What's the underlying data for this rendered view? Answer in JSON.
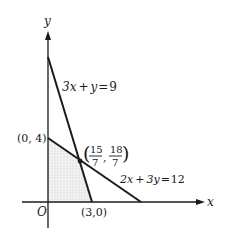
{
  "diagram": {
    "type": "linear-programming-feasible-region",
    "axes": {
      "x_label": "x",
      "y_label": "y",
      "origin_label": "O"
    },
    "lines": [
      {
        "id": "line1",
        "equation": "3x + y = 9",
        "lhs_a": "3x",
        "plus": "+",
        "lhs_b": "y",
        "eq": "=",
        "rhs": "9",
        "endpoints": [
          [
            0,
            9
          ],
          [
            3,
            0
          ]
        ]
      },
      {
        "id": "line2",
        "equation": "2x + 3y = 12",
        "lhs_a": "2x",
        "plus": "+",
        "lhs_b": "3y",
        "eq": "=",
        "rhs": "12",
        "endpoints": [
          [
            0,
            4
          ],
          [
            6,
            0
          ]
        ]
      }
    ],
    "points": {
      "p04": {
        "label": "(0, 4)",
        "x": 0,
        "y": 4
      },
      "p30": {
        "label": "(3,0)",
        "x": 3,
        "y": 0
      },
      "intersection": {
        "x_num": "15",
        "x_den": "7",
        "y_num": "18",
        "y_den": "7",
        "label": "(15/7, 18/7)"
      }
    },
    "shaded_region": "feasible region bounded by O, (3,0), (15/7,18/7), (0,4)",
    "colors": {
      "line": "#1a1a1a",
      "shade": "#e6e6e6"
    }
  }
}
